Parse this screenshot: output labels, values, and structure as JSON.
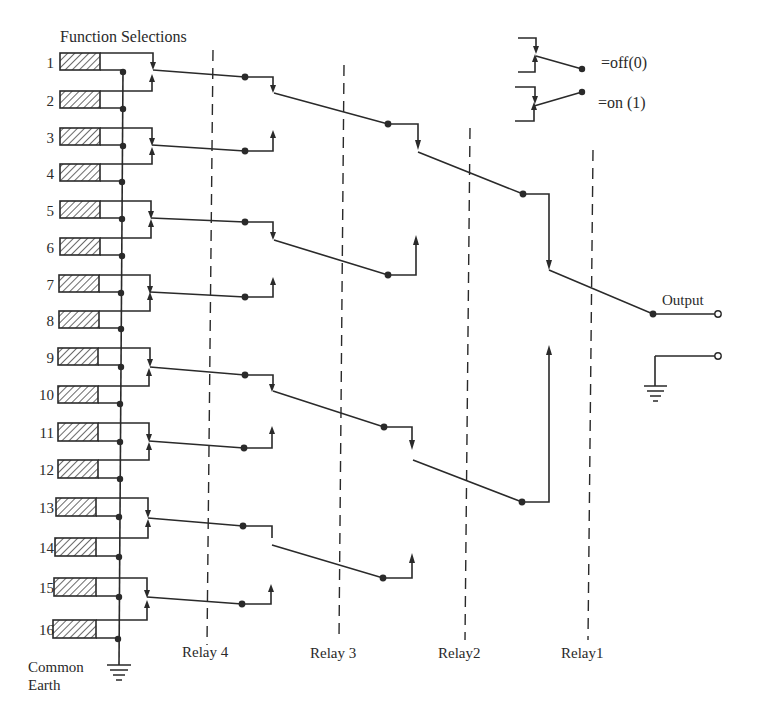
{
  "title": "Function Selections",
  "legend": {
    "off_label": "=off(0)",
    "on_label": "=on (1)"
  },
  "inputs": [
    "1",
    "2",
    "3",
    "4",
    "5",
    "6",
    "7",
    "8",
    "9",
    "10",
    "11",
    "12",
    "13",
    "14",
    "15",
    "16"
  ],
  "relays": [
    {
      "id": "relay4",
      "label": "Relay 4"
    },
    {
      "id": "relay3",
      "label": "Relay 3"
    },
    {
      "id": "relay2",
      "label": "Relay2"
    },
    {
      "id": "relay1",
      "label": "Relay1"
    }
  ],
  "output_label": "Output",
  "ground_label_line1": "Common",
  "ground_label_line2": "Earth",
  "colors": {
    "ink": "#2a2a2a",
    "background": "#ffffff"
  }
}
